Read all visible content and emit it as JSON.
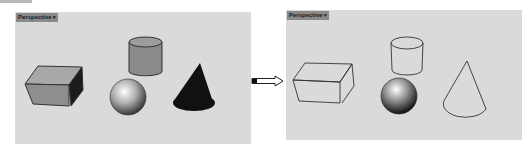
{
  "left_viewport": {
    "label": "Perspective",
    "mode": "shaded",
    "objects": [
      "box",
      "cylinder",
      "sphere",
      "cone"
    ]
  },
  "right_viewport": {
    "label": "Perspective",
    "mode": "wireframe",
    "objects": [
      "box",
      "cylinder",
      "sphere",
      "cone"
    ]
  },
  "dropdown_icon": "caret-down",
  "transition_icon": "arrow-right",
  "colors": {
    "viewport_bg": "#dadada",
    "label_bg": "#8a8a8a",
    "shaded_fill": "#8c8c8c",
    "cone_fill": "#111111",
    "edge": "#333333"
  }
}
